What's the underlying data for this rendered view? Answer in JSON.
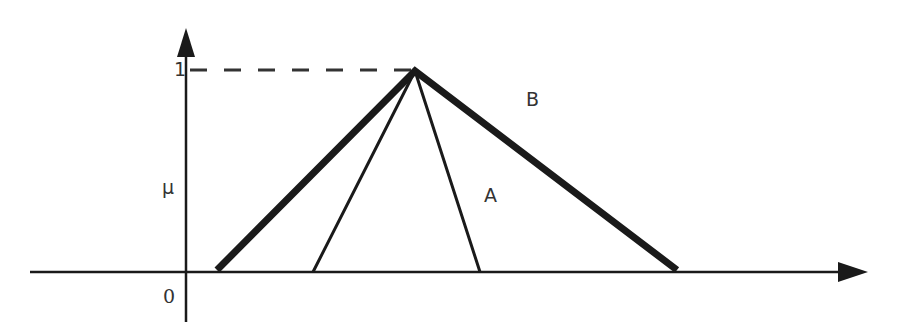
{
  "diagram": {
    "y_axis": {
      "label": "μ",
      "tick_top": "1",
      "origin": "0"
    },
    "x_axis": {
      "label": ""
    },
    "sets": [
      {
        "name": "A",
        "shape": "triangle",
        "line": "thin",
        "left": 313,
        "peak": 415,
        "right": 480
      },
      {
        "name": "B",
        "shape": "triangle",
        "line": "thick",
        "left": 217,
        "peak": 415,
        "right": 677
      }
    ],
    "labels": {
      "A": "A",
      "B": "B"
    },
    "colors": {
      "line": "#1a1a1a",
      "text": "#333333"
    }
  }
}
